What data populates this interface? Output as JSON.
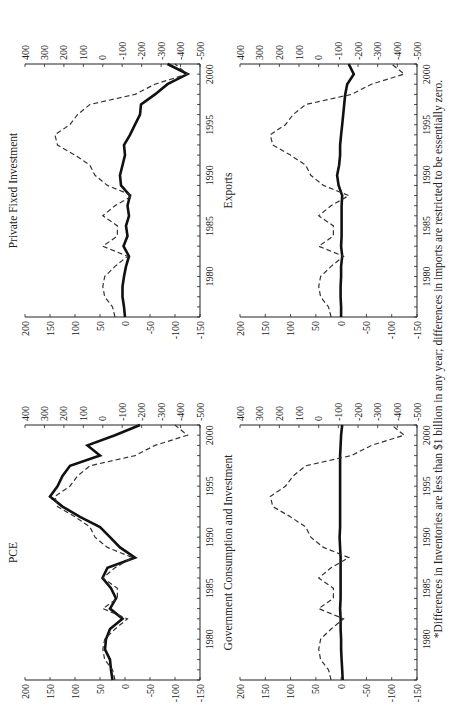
{
  "footnote": "*Differences in Inventories are less than $1 billion in any year; differences in imports are restricted to be essentially zero.",
  "colors": {
    "solid": "#111111",
    "dashed": "#333333",
    "axis": "#222222"
  },
  "chart_data": [
    {
      "type": "line",
      "title": "PCE",
      "x": [
        1976,
        1977,
        1978,
        1979,
        1980,
        1981,
        1982,
        1983,
        1984,
        1985,
        1986,
        1987,
        1988,
        1989,
        1990,
        1991,
        1992,
        1993,
        1994,
        1995,
        1996,
        1997,
        1998,
        1999,
        2000,
        2001
      ],
      "xticks": [
        1980,
        1985,
        1990,
        1995,
        2000
      ],
      "left_axis": {
        "ylim": [
          -150,
          200
        ],
        "ticks": [
          200,
          150,
          100,
          50,
          0,
          -50,
          -100,
          -150
        ]
      },
      "right_axis": {
        "ylim": [
          -500,
          400
        ],
        "ticks": [
          400,
          300,
          200,
          100,
          0,
          -100,
          -200,
          -300,
          -400,
          -500
        ]
      },
      "series": [
        {
          "name": "solid (left axis)",
          "style": "solid",
          "axis": "left",
          "values": [
            25,
            28,
            30,
            40,
            38,
            30,
            5,
            30,
            18,
            28,
            45,
            35,
            -20,
            10,
            30,
            50,
            90,
            125,
            150,
            135,
            125,
            110,
            50,
            75,
            20,
            -30
          ]
        },
        {
          "name": "dashed (right axis)",
          "style": "dashed",
          "axis": "right",
          "values": [
            -63,
            -50,
            -10,
            0,
            -10,
            -63,
            -127,
            0,
            -75,
            -75,
            0,
            -63,
            -153,
            -24,
            40,
            66,
            143,
            233,
            246,
            169,
            130,
            66,
            -166,
            -268,
            -435,
            -371
          ]
        }
      ]
    },
    {
      "type": "line",
      "title": "Private Fixed Investment",
      "x": [
        1976,
        1977,
        1978,
        1979,
        1980,
        1981,
        1982,
        1983,
        1984,
        1985,
        1986,
        1987,
        1988,
        1989,
        1990,
        1991,
        1992,
        1993,
        1994,
        1995,
        1996,
        1997,
        1998,
        1999,
        2000,
        2001
      ],
      "xticks": [
        1980,
        1985,
        1990,
        1995,
        2000
      ],
      "left_axis": {
        "ylim": [
          -150,
          200
        ],
        "ticks": [
          200,
          150,
          100,
          50,
          0,
          -50,
          -100,
          -150
        ]
      },
      "right_axis": {
        "ylim": [
          -500,
          400
        ],
        "ticks": [
          400,
          300,
          200,
          100,
          0,
          -100,
          -200,
          -300,
          -400,
          -500
        ]
      },
      "series": [
        {
          "name": "solid (left axis)",
          "style": "solid",
          "axis": "left",
          "values": [
            0,
            2,
            5,
            5,
            2,
            -2,
            -8,
            3,
            -5,
            -2,
            -8,
            -5,
            -10,
            8,
            10,
            5,
            0,
            2,
            -10,
            -20,
            -30,
            -32,
            -60,
            -85,
            -125,
            -85
          ]
        },
        {
          "name": "dashed (right axis)",
          "style": "dashed",
          "axis": "right",
          "values": [
            -63,
            -50,
            -10,
            0,
            -10,
            -63,
            -127,
            0,
            -75,
            -75,
            0,
            -63,
            -153,
            -24,
            40,
            66,
            143,
            233,
            246,
            169,
            130,
            66,
            -166,
            -268,
            -435,
            -371
          ]
        }
      ]
    },
    {
      "type": "line",
      "title": "Government Consumption and Investment",
      "x": [
        1976,
        1977,
        1978,
        1979,
        1980,
        1981,
        1982,
        1983,
        1984,
        1985,
        1986,
        1987,
        1988,
        1989,
        1990,
        1991,
        1992,
        1993,
        1994,
        1995,
        1996,
        1997,
        1998,
        1999,
        2000,
        2001
      ],
      "xticks": [
        1980,
        1985,
        1990,
        1995,
        2000
      ],
      "left_axis": {
        "ylim": [
          -150,
          200
        ],
        "ticks": [
          200,
          150,
          100,
          50,
          0,
          -50,
          -100,
          -150
        ]
      },
      "right_axis": {
        "ylim": [
          -500,
          400
        ],
        "ticks": [
          400,
          300,
          200,
          100,
          0,
          -100,
          -200,
          -300,
          -400,
          -500
        ]
      },
      "series": [
        {
          "name": "solid (left axis)",
          "style": "solid",
          "axis": "left",
          "values": [
            -3,
            -2,
            -1,
            0,
            0,
            1,
            1,
            2,
            1,
            1,
            1,
            1,
            1,
            2,
            3,
            2,
            2,
            2,
            2,
            2,
            2,
            2,
            2,
            1,
            0,
            -2
          ]
        },
        {
          "name": "dashed (right axis)",
          "style": "dashed",
          "axis": "right",
          "values": [
            -63,
            -50,
            -10,
            0,
            -10,
            -63,
            -127,
            0,
            -75,
            -75,
            0,
            -63,
            -153,
            -24,
            40,
            66,
            143,
            233,
            246,
            169,
            130,
            66,
            -166,
            -268,
            -435,
            -371
          ]
        }
      ]
    },
    {
      "type": "line",
      "title": "Exports",
      "x": [
        1976,
        1977,
        1978,
        1979,
        1980,
        1981,
        1982,
        1983,
        1984,
        1985,
        1986,
        1987,
        1988,
        1989,
        1990,
        1991,
        1992,
        1993,
        1994,
        1995,
        1996,
        1997,
        1998,
        1999,
        2000,
        2001
      ],
      "xticks": [
        1980,
        1985,
        1990,
        1995,
        2000
      ],
      "left_axis": {
        "ylim": [
          -150,
          200
        ],
        "ticks": [
          200,
          150,
          100,
          50,
          0,
          -50,
          -100,
          -150
        ]
      },
      "right_axis": {
        "ylim": [
          -500,
          400
        ],
        "ticks": [
          400,
          300,
          200,
          100,
          0,
          -100,
          -200,
          -300,
          -400,
          -500
        ]
      },
      "series": [
        {
          "name": "solid (left axis)",
          "style": "solid",
          "axis": "left",
          "values": [
            0,
            0,
            1,
            1,
            0,
            0,
            -2,
            0,
            -1,
            -1,
            -1,
            -1,
            -2,
            5,
            8,
            4,
            2,
            2,
            0,
            -2,
            -4,
            -6,
            -8,
            -12,
            -25,
            -15
          ]
        },
        {
          "name": "dashed (right axis)",
          "style": "dashed",
          "axis": "right",
          "values": [
            -63,
            -50,
            -10,
            0,
            -10,
            -63,
            -127,
            0,
            -75,
            -75,
            0,
            -63,
            -153,
            -24,
            40,
            66,
            143,
            233,
            246,
            169,
            130,
            66,
            -166,
            -268,
            -435,
            -371
          ]
        }
      ]
    }
  ],
  "panels_layout": [
    {
      "chart_index": 0,
      "x0": 38,
      "x1": 293,
      "y0": 25,
      "y1": 200
    },
    {
      "chart_index": 1,
      "x0": 401,
      "x1": 654,
      "y0": 25,
      "y1": 200
    },
    {
      "chart_index": 2,
      "x0": 38,
      "x1": 293,
      "y0": 240,
      "y1": 417
    },
    {
      "chart_index": 3,
      "x0": 401,
      "x1": 654,
      "y0": 240,
      "y1": 417
    }
  ]
}
